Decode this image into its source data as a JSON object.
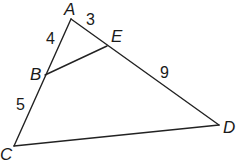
{
  "diagram": {
    "type": "triangle-with-parallel-segment",
    "vertices": {
      "A": {
        "label": "A",
        "x": 71,
        "y": 19
      },
      "B": {
        "label": "B",
        "x": 45,
        "y": 75
      },
      "C": {
        "label": "C",
        "x": 14,
        "y": 146
      },
      "D": {
        "label": "D",
        "x": 219,
        "y": 125
      },
      "E": {
        "label": "E",
        "x": 107,
        "y": 46
      }
    },
    "segments": [
      {
        "from": "A",
        "to": "C"
      },
      {
        "from": "A",
        "to": "D"
      },
      {
        "from": "C",
        "to": "D"
      },
      {
        "from": "B",
        "to": "E"
      }
    ],
    "lengths": {
      "AB": "4",
      "BC": "5",
      "AE": "3",
      "ED": "9"
    }
  }
}
